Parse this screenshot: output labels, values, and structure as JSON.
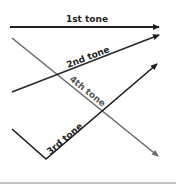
{
  "diagram": {
    "tones": [
      {
        "id": "1st",
        "label": "1st tone",
        "color": "#1f1f1f",
        "shape": "level"
      },
      {
        "id": "2nd",
        "label": "2nd tone",
        "color": "#2a2a2a",
        "shape": "rising"
      },
      {
        "id": "3rd",
        "label": "3rd tone",
        "color": "#1a1a1a",
        "shape": "falling-rising"
      },
      {
        "id": "4th",
        "label": "4th tone",
        "color": "#6a6a6a",
        "shape": "falling"
      }
    ]
  }
}
